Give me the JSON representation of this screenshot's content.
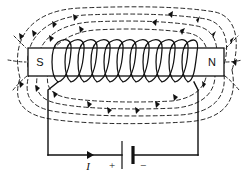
{
  "diagram": {
    "colors": {
      "ink": "#111111",
      "background": "#ffffff"
    },
    "core": {
      "name": "iron-core-bar",
      "left_pole_label": "S",
      "right_pole_label": "N",
      "x": 28,
      "y": 48,
      "width": 196,
      "height": 28
    },
    "coil": {
      "name": "solenoid-coil",
      "turns": 11,
      "start_x": 56,
      "end_x": 194,
      "top_y": 40,
      "bottom_y": 84
    },
    "field_lines": {
      "name": "magnetic-field-lines",
      "style": "dashed",
      "count": 8,
      "arrowheads": 22,
      "description": "dashed closed loops running from N pole around to S pole"
    },
    "circuit": {
      "name": "external-circuit",
      "left_wire_x": 48,
      "right_wire_x": 198,
      "bottom_wire_y": 155,
      "current_label": "I",
      "current_direction": "right",
      "battery": {
        "name": "battery-cell",
        "positive_label": "+",
        "negative_label": "−",
        "center_x": 126,
        "long_plate_x": 122,
        "short_plate_x": 133
      }
    }
  }
}
